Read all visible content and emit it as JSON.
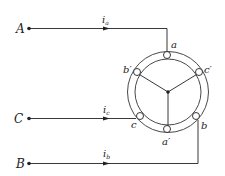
{
  "terminals": {
    "A": {
      "label": "A",
      "current": "i",
      "sub": "a"
    },
    "C": {
      "label": "C",
      "current": "i",
      "sub": "c"
    },
    "B": {
      "label": "B",
      "current": "i",
      "sub": "b"
    }
  },
  "slots": {
    "a": "a",
    "b": "b",
    "c": "c",
    "a_prime": "a′",
    "b_prime": "b′",
    "c_prime": "c′"
  },
  "colors": {
    "line": "#222222",
    "background": "#ffffff"
  }
}
